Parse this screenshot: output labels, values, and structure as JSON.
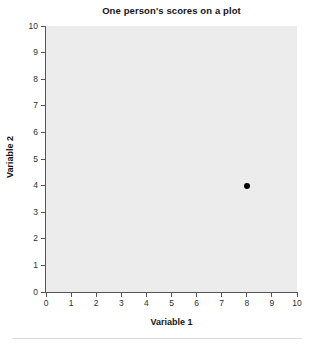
{
  "chart_data": {
    "type": "scatter",
    "title": "One person's scores on a plot",
    "xlabel": "Variable 1",
    "ylabel": "Variable 2",
    "xlim": [
      0,
      10
    ],
    "ylim": [
      0,
      10
    ],
    "xticks": [
      "0",
      "1",
      "2",
      "3",
      "4",
      "5",
      "6",
      "7",
      "8",
      "9",
      "10"
    ],
    "yticks": [
      "0",
      "1",
      "2",
      "3",
      "4",
      "5",
      "6",
      "7",
      "8",
      "9",
      "10"
    ],
    "grid": false,
    "legend": false,
    "series": [
      {
        "name": "One person",
        "marker": "filled-circle",
        "color": "#000000",
        "points": [
          {
            "x": 8,
            "y": 4
          }
        ]
      }
    ],
    "plot_background": "#ececec",
    "figure_background": "#ffffff",
    "axis_color": "#555555",
    "text_color": "#141414"
  }
}
